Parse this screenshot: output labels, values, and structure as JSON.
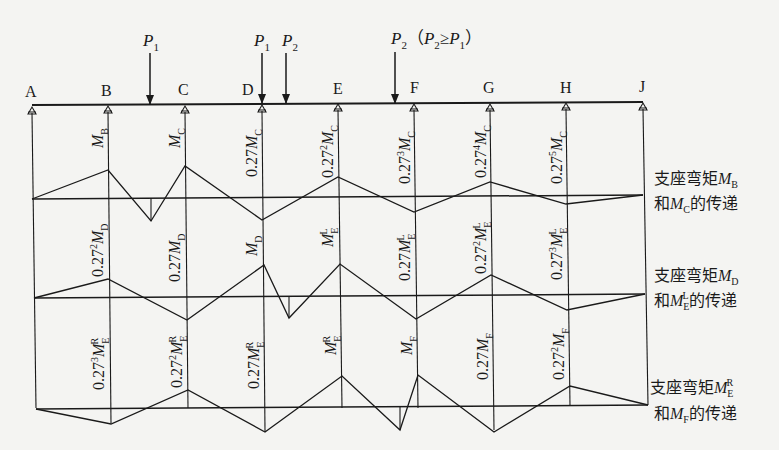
{
  "figure": {
    "supports": [
      "A",
      "B",
      "C",
      "D",
      "E",
      "F",
      "G",
      "H",
      "J"
    ],
    "loads": [
      {
        "label": "P",
        "sub": "1",
        "note": ""
      },
      {
        "label": "P",
        "sub": "1",
        "note": ""
      },
      {
        "label": "P",
        "sub": "2",
        "note": ""
      },
      {
        "label": "P",
        "sub": "2",
        "note": "（P₂≥P₁）"
      }
    ],
    "load_note": {
      "open": "（",
      "p2": "P",
      "p2_sub": "2",
      "ge": "≥",
      "p1": "P",
      "p1_sub": "1",
      "close": "）"
    },
    "bands": [
      {
        "title_line1": "支座弯矩",
        "title_sym1": "M",
        "title_sub1": "B",
        "title_sup1": "",
        "title_line2_pre": "和",
        "title_sym2": "M",
        "title_sub2": "C",
        "title_sup2": "",
        "title_line2_post": "的传递",
        "labels": [
          {
            "coef": "",
            "exp": "",
            "sym": "M",
            "sub": "B",
            "sup": ""
          },
          {
            "coef": "",
            "exp": "",
            "sym": "M",
            "sub": "C",
            "sup": ""
          },
          {
            "coef": "0.27",
            "exp": "",
            "sym": "M",
            "sub": "C",
            "sup": ""
          },
          {
            "coef": "0.27",
            "exp": "2",
            "sym": "M",
            "sub": "C",
            "sup": ""
          },
          {
            "coef": "0.27",
            "exp": "3",
            "sym": "M",
            "sub": "C",
            "sup": ""
          },
          {
            "coef": "0.27",
            "exp": "4",
            "sym": "M",
            "sub": "C",
            "sup": ""
          },
          {
            "coef": "0.27",
            "exp": "5",
            "sym": "M",
            "sub": "C",
            "sup": ""
          }
        ]
      },
      {
        "title_line1": "支座弯矩",
        "title_sym1": "M",
        "title_sub1": "D",
        "title_sup1": "",
        "title_line2_pre": "和",
        "title_sym2": "M",
        "title_sub2": "E",
        "title_sup2": "L",
        "title_line2_post": "的传递",
        "labels": [
          {
            "coef": "0.27",
            "exp": "2",
            "sym": "M",
            "sub": "D",
            "sup": ""
          },
          {
            "coef": "0.27",
            "exp": "",
            "sym": "M",
            "sub": "D",
            "sup": ""
          },
          {
            "coef": "",
            "exp": "",
            "sym": "M",
            "sub": "D",
            "sup": ""
          },
          {
            "coef": "",
            "exp": "",
            "sym": "M",
            "sub": "E",
            "sup": "L"
          },
          {
            "coef": "0.27",
            "exp": "",
            "sym": "M",
            "sub": "E",
            "sup": "L"
          },
          {
            "coef": "0.27",
            "exp": "2",
            "sym": "M",
            "sub": "E",
            "sup": "L"
          },
          {
            "coef": "0.27",
            "exp": "3",
            "sym": "M",
            "sub": "E",
            "sup": "L"
          }
        ]
      },
      {
        "title_line1": "支座弯矩",
        "title_sym1": "M",
        "title_sub1": "E",
        "title_sup1": "R",
        "title_line2_pre": "和",
        "title_sym2": "M",
        "title_sub2": "F",
        "title_sup2": "",
        "title_line2_post": "的传递",
        "labels": [
          {
            "coef": "0.27",
            "exp": "3",
            "sym": "M",
            "sub": "E",
            "sup": "R"
          },
          {
            "coef": "0.27",
            "exp": "2",
            "sym": "M",
            "sub": "E",
            "sup": "R"
          },
          {
            "coef": "0.27",
            "exp": "",
            "sym": "M",
            "sub": "E",
            "sup": "R"
          },
          {
            "coef": "",
            "exp": "",
            "sym": "M",
            "sub": "E",
            "sup": "R"
          },
          {
            "coef": "",
            "exp": "",
            "sym": "M",
            "sub": "F",
            "sup": ""
          },
          {
            "coef": "0.27",
            "exp": "",
            "sym": "M",
            "sub": "F",
            "sup": ""
          },
          {
            "coef": "0.27",
            "exp": "2",
            "sym": "M",
            "sub": "F",
            "sup": ""
          }
        ]
      }
    ]
  }
}
